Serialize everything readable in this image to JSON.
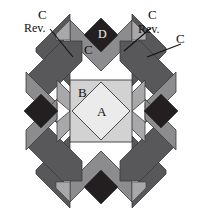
{
  "figure": {
    "type": "quilt-block-piecing-diagram",
    "background": "#ffffff"
  },
  "palette": {
    "white": "#ffffff",
    "near_black": "#231f20",
    "dark_gray": "#58585b",
    "mid_gray": "#8c8c8e",
    "light_mid_gray": "#a8a8aa",
    "light_gray": "#d2d2d2",
    "very_light_gray": "#ebebeb",
    "outline": "#3a3a3a",
    "text": "#111111",
    "text_on_dark": "#f2f2f2"
  },
  "labels": {
    "patch_a": "A",
    "patch_b": "B",
    "patch_c_center_top": "C",
    "patch_d": "D",
    "top_left_c": "C",
    "top_left_rev": "Rev.",
    "top_right_c": "C",
    "top_right_rev": "Rev.",
    "far_right_c": "C"
  },
  "pieces": [
    {
      "id": "A",
      "name": "center-diamond",
      "label": "A",
      "fill": "#ebebeb"
    },
    {
      "id": "B",
      "name": "center-square",
      "label": "B",
      "fill": "#d2d2d2"
    },
    {
      "id": "C",
      "name": "chevron-point",
      "label": "C",
      "fill": "#8c8c8e"
    },
    {
      "id": "D",
      "name": "tip-diamond",
      "label": "D",
      "fill": "#231f20"
    }
  ],
  "leaders": [
    {
      "name": "leader-top-left",
      "from": "top_left_rev",
      "to": "upper-left-dark-wing"
    },
    {
      "name": "leader-top-right",
      "from": "top_right_rev",
      "to": "upper-right-mid-wing"
    },
    {
      "name": "leader-far-right",
      "from": "far_right_c",
      "to": "upper-right-dark-wing"
    }
  ]
}
